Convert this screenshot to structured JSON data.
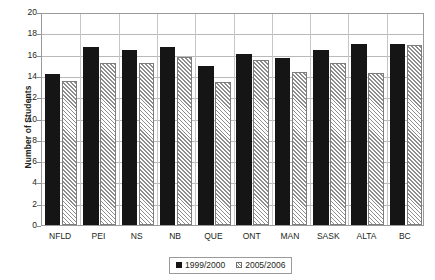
{
  "chart_data": {
    "type": "bar",
    "title": "",
    "xlabel": "",
    "ylabel": "Number of Students",
    "ylim": [
      0,
      20
    ],
    "ytick_step": 2,
    "yticks": [
      20,
      18,
      16,
      14,
      12,
      10,
      8,
      6,
      4,
      2,
      0
    ],
    "grid": true,
    "legend_position": "bottom-center",
    "categories": [
      "NFLD",
      "PEI",
      "NS",
      "NB",
      "QUE",
      "ONT",
      "MAN",
      "SASK",
      "ALTA",
      "BC"
    ],
    "series": [
      {
        "name": "1999/2000",
        "style": "solid-black",
        "color": "#151515",
        "values": [
          14.2,
          16.7,
          16.4,
          16.7,
          14.9,
          16.1,
          15.7,
          16.4,
          17.0,
          17.0
        ]
      },
      {
        "name": "2005/2006",
        "style": "white-diagonal-hatch",
        "color": "#ffffff",
        "values": [
          13.5,
          15.2,
          15.2,
          15.8,
          13.4,
          15.5,
          14.4,
          15.2,
          14.3,
          16.9
        ]
      }
    ]
  },
  "legend": {
    "items": [
      {
        "label": "1999/2000",
        "swatch": "solid-black-square-icon"
      },
      {
        "label": "2005/2006",
        "swatch": "hatched-square-icon"
      }
    ]
  }
}
